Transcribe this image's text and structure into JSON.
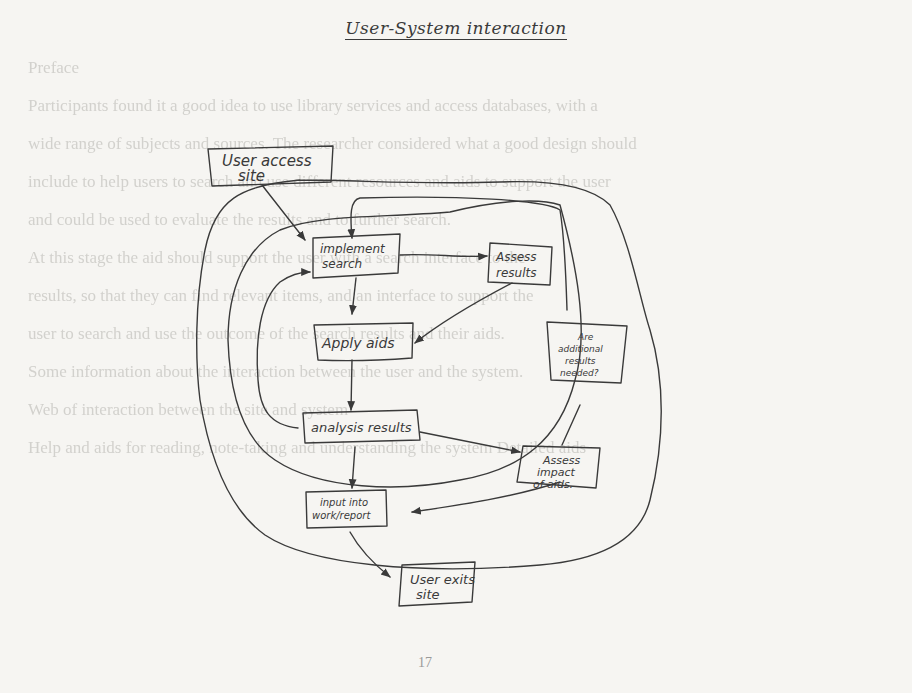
{
  "document": {
    "title": "User-System interaction",
    "page_number": "17",
    "background_text": [
      "Preface",
      "Participants found it a good idea to use library services and access databases, with a",
      "wide range of subjects and sources. The researcher considered what a good design should",
      "include to help users to search and use different resources and aids to support the user",
      "and could be used to evaluate the results and to further search.",
      "",
      "At this stage the aid should support the user with a search interface to the",
      "results, so that they can find relevant items, and an interface to support the",
      "user to search and use the outcome of the search results and their aids.",
      "",
      "Some information about the interaction between the user and the system.",
      "",
      "Web of interaction between the site and system",
      "",
      "Help and aids for reading, note-taking and understanding the system Detailed aids"
    ]
  },
  "diagram": {
    "nodes": [
      {
        "id": "user-access-site",
        "label_lines": [
          "User access",
          "site"
        ]
      },
      {
        "id": "implement-search",
        "label_lines": [
          "implement",
          "search"
        ]
      },
      {
        "id": "assess-results",
        "label_lines": [
          "Assess",
          "results"
        ]
      },
      {
        "id": "apply-aids",
        "label_lines": [
          "Apply aids"
        ]
      },
      {
        "id": "additional-results",
        "label_lines": [
          "Are",
          "additional",
          "results",
          "needed?"
        ]
      },
      {
        "id": "analysis-results",
        "label_lines": [
          "analysis results"
        ]
      },
      {
        "id": "assess-impact",
        "label_lines": [
          "Assess",
          "impact",
          "of aids."
        ]
      },
      {
        "id": "input-work",
        "label_lines": [
          "input into",
          "work/report"
        ]
      },
      {
        "id": "user-exits-site",
        "label_lines": [
          "User exits",
          "site"
        ]
      }
    ],
    "edges": [
      {
        "from": "user-access-site",
        "to": "implement-search"
      },
      {
        "from": "implement-search",
        "to": "assess-results"
      },
      {
        "from": "implement-search",
        "to": "apply-aids"
      },
      {
        "from": "assess-results",
        "to": "apply-aids"
      },
      {
        "from": "apply-aids",
        "to": "analysis-results"
      },
      {
        "from": "analysis-results",
        "to": "implement-search",
        "kind": "inner-loop"
      },
      {
        "from": "analysis-results",
        "to": "assess-impact"
      },
      {
        "from": "analysis-results",
        "to": "input-work"
      },
      {
        "from": "assess-impact",
        "to": "additional-results"
      },
      {
        "from": "additional-results",
        "to": "implement-search",
        "kind": "right-loop"
      },
      {
        "from": "assess-impact",
        "to": "input-work"
      },
      {
        "from": "input-work",
        "to": "user-exits-site"
      }
    ],
    "ink_color": "#3a3a3a",
    "paper_color": "#f6f5f2"
  }
}
